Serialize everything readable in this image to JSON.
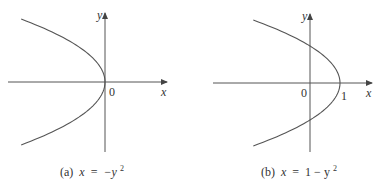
{
  "chart_data": [
    {
      "type": "line",
      "panel": "a",
      "caption": {
        "prefix": "(a)",
        "equation_lhs": "x",
        "equation_op": "=",
        "equation_rhs": "−y",
        "exponent": "2"
      },
      "equation": "x = -y^2",
      "xlabel": "x",
      "ylabel": "y",
      "origin_label": "0",
      "tick_labels": [],
      "xlim": [
        -3.4,
        2.2
      ],
      "ylim": [
        -1.9,
        1.9
      ],
      "grid": false,
      "series": [
        {
          "name": "x = -y^2",
          "x": [
            -2.89,
            -1.96,
            -1.21,
            -0.64,
            -0.25,
            -0.04,
            0,
            -0.04,
            -0.25,
            -0.64,
            -1.21,
            -1.96,
            -2.89
          ],
          "y": [
            1.7,
            1.4,
            1.1,
            0.8,
            0.5,
            0.2,
            0,
            -0.2,
            -0.5,
            -0.8,
            -1.1,
            -1.4,
            -1.7
          ]
        }
      ]
    },
    {
      "type": "line",
      "panel": "b",
      "caption": {
        "prefix": "(b)",
        "equation_lhs": "x",
        "equation_op": "=",
        "equation_rhs": "1 − y",
        "exponent": "2"
      },
      "equation": "x = 1 - y^2",
      "xlabel": "x",
      "ylabel": "y",
      "origin_label": "0",
      "tick_labels": [
        "1"
      ],
      "xlim": [
        -3.3,
        2.2
      ],
      "ylim": [
        -1.9,
        1.9
      ],
      "grid": false,
      "series": [
        {
          "name": "x = 1 - y^2",
          "x": [
            -1.89,
            -0.96,
            -0.21,
            0.36,
            0.75,
            0.96,
            1,
            0.96,
            0.75,
            0.36,
            -0.21,
            -0.96,
            -1.89
          ],
          "y": [
            1.7,
            1.4,
            1.1,
            0.8,
            0.5,
            0.2,
            0,
            -0.2,
            -0.5,
            -0.8,
            -1.1,
            -1.4,
            -1.7
          ]
        }
      ]
    }
  ]
}
